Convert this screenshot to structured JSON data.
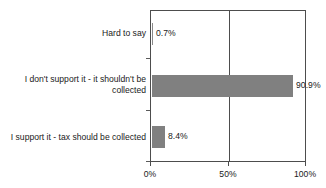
{
  "chart_data": {
    "type": "bar",
    "orientation": "horizontal",
    "title": "",
    "subtitle": "",
    "xlabel": "",
    "ylabel": "",
    "categories": [
      "Hard to say",
      "I don't support it - it shouldn't be collected",
      "I support it - tax should be collected"
    ],
    "values": [
      0.7,
      90.9,
      8.4
    ],
    "data_labels": [
      "0.7%",
      "90.9%",
      "8.4%"
    ],
    "xlim": [
      0,
      100
    ],
    "xticks": [
      0,
      50,
      100
    ],
    "xtick_labels": [
      "0%",
      "50%",
      "100%"
    ],
    "grid": true,
    "gridlines_x": [
      50
    ],
    "legend": null,
    "legend_position": "none",
    "bar_color": "#808080",
    "axis_color": "#4d4d4d",
    "text_color": "#1a1a1a",
    "background": "#ffffff"
  }
}
